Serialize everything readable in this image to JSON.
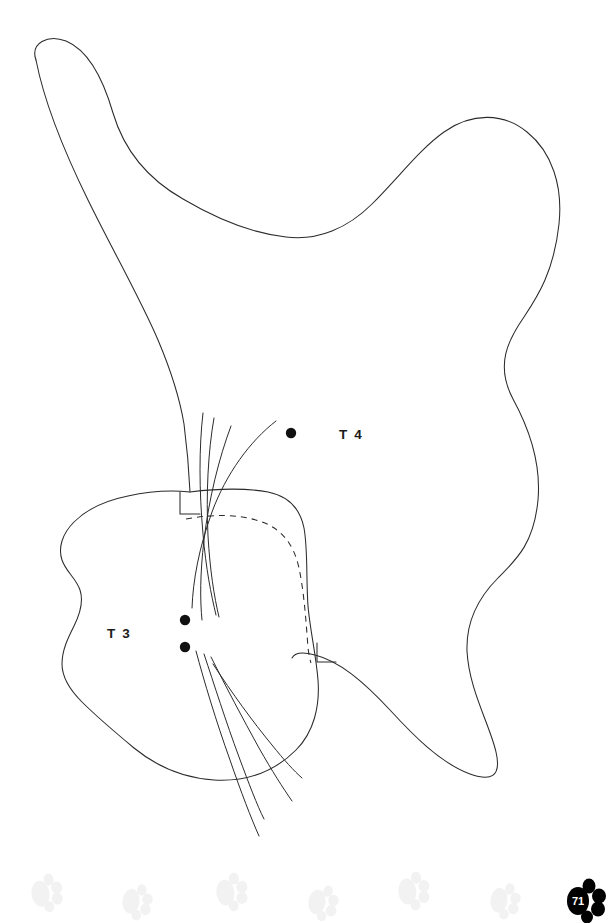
{
  "page": {
    "width": 611,
    "height": 923,
    "background_color": "#ffffff",
    "ink_color": "#2b2b2b",
    "type": "sewing-pattern-sheet",
    "page_number": "71"
  },
  "pieces": [
    {
      "id": "T4",
      "label": "T 4",
      "label_x": 339,
      "label_y": 439,
      "description": "large irregular body panel outline",
      "mark_dots": [
        {
          "cx": 291,
          "cy": 433,
          "r": 5.2
        }
      ]
    },
    {
      "id": "T3",
      "label": "T 3",
      "label_x": 107,
      "label_y": 638,
      "description": "rounded head panel with dashed seam allowance",
      "mark_dots": [
        {
          "cx": 185,
          "cy": 620,
          "r": 5.2
        },
        {
          "cx": 185,
          "cy": 647,
          "r": 5.2
        }
      ]
    }
  ],
  "footer": {
    "page_number": "71",
    "badge_name": "paw-print-page-number",
    "badge_color": "#000000",
    "badge_text_color": "#ffffff",
    "watermark_color": "#f2f2f2",
    "watermark_count": 7
  },
  "watermark_paws": [
    {
      "x": 46,
      "y": 890,
      "scale": 1.0,
      "rotate": -8
    },
    {
      "x": 137,
      "y": 899,
      "scale": 0.95,
      "rotate": 6
    },
    {
      "x": 231,
      "y": 889,
      "scale": 1.0,
      "rotate": -6
    },
    {
      "x": 323,
      "y": 900,
      "scale": 0.95,
      "rotate": 8
    },
    {
      "x": 413,
      "y": 888,
      "scale": 1.0,
      "rotate": -5
    },
    {
      "x": 505,
      "y": 898,
      "scale": 0.95,
      "rotate": 7
    }
  ],
  "geometry": {
    "t4_outline": "M 36 60 C 30 43 48 34 66 41 C 90 51 104 82 113 113 C 124 150 146 178 183 199 C 222 222 258 234 286 237 C 318 241 348 228 372 204 C 400 176 420 149 444 132 C 472 112 504 113 527 132 C 552 152 563 186 559 224 C 554 271 538 296 524 317 C 508 340 495 365 513 399 C 531 432 541 466 538 500 C 534 543 517 559 498 578 C 478 598 466 622 467 651 C 469 690 490 725 496 752 C 502 778 490 781 470 774 C 440 763 412 734 390 710 C 363 681 339 661 315 655 C 300 651 294 654 292 658",
    "t4_outline_left": "M 36 60 C 43 96 60 143 88 200 C 112 249 141 300 158 340 C 172 373 180 400 184 424 C 187 447 189 470 190 492",
    "t3_outline": "M 190 492 C 170 490 146 492 128 496 C 108 500 88 508 74 522 C 62 534 58 548 62 560 C 66 572 76 578 80 590 C 84 602 80 614 74 626 C 68 638 62 650 62 664 C 62 678 70 690 82 702 C 96 716 116 733 134 748 C 156 766 184 778 214 780 C 248 782 276 770 296 750 C 314 732 320 706 318 680 C 316 654 310 630 308 606 C 306 578 308 550 304 528 C 300 508 288 496 268 492 C 240 487 214 489 190 492 Z",
    "t3_seam_dashed": "M 186 519 C 214 514 240 514 262 522 C 282 529 294 545 299 568 C 304 592 306 620 308 648 C 309 655 310 660 311 663",
    "notch_top": "M 180 492 L 180 514 L 200 514",
    "notch_bottom": "M 317 643 L 317 662 L 336 662",
    "whiskers_upper": [
      "M 203 413 C 199 447 199 490 203 534 C 206 569 211 594 216 615",
      "M 214 418 C 208 452 206 494 208 536 C 210 570 214 596 219 617",
      "M 231 426 C 219 458 209 498 204 540 C 200 574 200 600 202 620",
      "M 276 421 C 250 441 226 474 212 512 C 199 548 193 580 192 608"
    ],
    "whiskers_lower": [
      "M 196 651 C 204 681 216 721 230 760 C 241 792 251 818 259 836",
      "M 204 654 C 214 684 226 722 239 757 C 249 784 257 805 264 819",
      "M 211 657 C 226 687 243 719 259 748 C 272 771 283 788 292 801",
      "M 213 664 C 232 693 253 722 272 745 C 284 760 294 771 302 778"
    ]
  }
}
